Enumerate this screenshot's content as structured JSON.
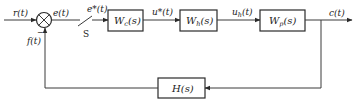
{
  "diagram": {
    "type": "control-system-block-diagram",
    "signals": {
      "input": "r(t)",
      "error": "e(t)",
      "sampled_error": "e*(t)",
      "controller_output": "u*(t)",
      "hold_output_base": "u",
      "hold_output_sub": "h",
      "hold_output_arg": "(t)",
      "output": "c(t)",
      "feedback": "f(t)"
    },
    "switch_label": "S",
    "summing_junction": {
      "feedback_sign": "−"
    },
    "blocks": [
      {
        "id": "controller",
        "base": "W",
        "sub": "c",
        "arg": "(s)"
      },
      {
        "id": "hold",
        "base": "W",
        "sub": "h",
        "arg": "(s)"
      },
      {
        "id": "plant",
        "base": "W",
        "sub": "p",
        "arg": "(s)"
      },
      {
        "id": "feedback",
        "base": "H",
        "sub": "",
        "arg": "(s)"
      }
    ],
    "colors": {
      "line": "#3a3a3a",
      "background": "#ffffff"
    }
  }
}
